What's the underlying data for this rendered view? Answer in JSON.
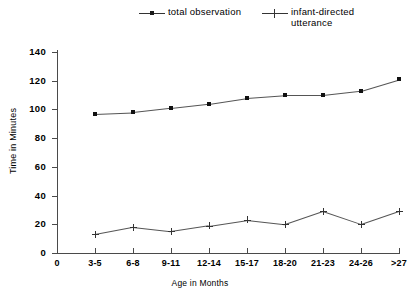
{
  "chart_data": {
    "type": "line",
    "title": "",
    "xlabel": "Age in Months",
    "ylabel": "Time in Minutes",
    "categories": [
      "0",
      "3-5",
      "6-8",
      "9-11",
      "12-14",
      "15-17",
      "18-20",
      "21-23",
      "24-26",
      ">27"
    ],
    "ylim": [
      0,
      140
    ],
    "yticks": [
      0,
      20,
      40,
      60,
      80,
      100,
      120,
      140
    ],
    "grid": false,
    "legend_position": "top",
    "series": [
      {
        "name": "total observation",
        "marker": "filled-square",
        "x": [
          "3-5",
          "6-8",
          "9-11",
          "12-14",
          "15-17",
          "18-20",
          "21-23",
          "24-26",
          ">27"
        ],
        "values": [
          97,
          98,
          101,
          104,
          108,
          110,
          110,
          113,
          121
        ]
      },
      {
        "name": "infant-directed\nutterance",
        "marker": "plus",
        "x": [
          "3-5",
          "6-8",
          "9-11",
          "12-14",
          "15-17",
          "18-20",
          "21-23",
          "24-26",
          ">27"
        ],
        "values": [
          13,
          18,
          15,
          19,
          23,
          20,
          29,
          20,
          29
        ]
      }
    ]
  },
  "legend": {
    "entries": [
      {
        "label": "total observation"
      },
      {
        "label": "infant-directed\nutterance"
      }
    ]
  }
}
